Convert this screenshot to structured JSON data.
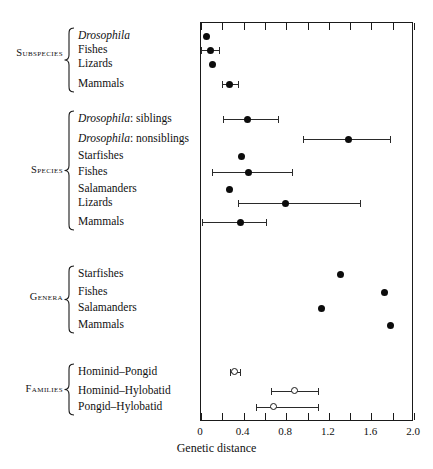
{
  "axis_title": "Genetic distance",
  "axis": {
    "labels": [
      "0",
      "0.4",
      "0.8",
      "1.2",
      "1.6",
      "2.0"
    ],
    "label_values": [
      0,
      0.4,
      0.8,
      1.2,
      1.6,
      2.0
    ],
    "minor_step": 0.2,
    "min": 0,
    "max": 2.0
  },
  "groups": [
    {
      "name": "Subspecies",
      "label": "Subspecies"
    },
    {
      "name": "Species",
      "label": "Species"
    },
    {
      "name": "Genera",
      "label": "Genera"
    },
    {
      "name": "Families",
      "label": "Families"
    }
  ],
  "chart_data": {
    "type": "scatter",
    "title": "",
    "xlabel": "Genetic distance",
    "ylabel": "",
    "xlim": [
      0,
      2.0
    ],
    "grid": false,
    "legend": "none",
    "orientation": "horizontal",
    "marker_note": "filled circles = animal taxa; open circles = primate families",
    "groups": [
      {
        "group": "Subspecies",
        "points": [
          {
            "label": "Drosophila",
            "italic_label": true,
            "value": 0.06,
            "low": null,
            "high": null,
            "marker": "filled"
          },
          {
            "label": "Fishes",
            "italic_label": false,
            "value": 0.1,
            "low": 0.01,
            "high": 0.18,
            "marker": "filled"
          },
          {
            "label": "Lizards",
            "italic_label": false,
            "value": 0.12,
            "low": null,
            "high": null,
            "marker": "filled"
          },
          {
            "label": "Mammals",
            "italic_label": false,
            "value": 0.28,
            "low": 0.21,
            "high": 0.36,
            "marker": "filled"
          }
        ]
      },
      {
        "group": "Species",
        "points": [
          {
            "label": "Drosophila: siblings",
            "italic_label": true,
            "italic_prefix": "Drosophila",
            "rest": ": siblings",
            "value": 0.45,
            "low": 0.22,
            "high": 0.73,
            "marker": "filled"
          },
          {
            "label": "Drosophila: nonsiblings",
            "italic_label": true,
            "italic_prefix": "Drosophila",
            "rest": ": nonsiblings",
            "value": 1.39,
            "low": 0.97,
            "high": 1.78,
            "marker": "filled"
          },
          {
            "label": "Starfishes",
            "italic_label": false,
            "value": 0.39,
            "low": null,
            "high": null,
            "marker": "filled"
          },
          {
            "label": "Fishes",
            "italic_label": false,
            "value": 0.46,
            "low": 0.11,
            "high": 0.86,
            "marker": "filled"
          },
          {
            "label": "Salamanders",
            "italic_label": false,
            "value": 0.28,
            "low": null,
            "high": null,
            "marker": "filled"
          },
          {
            "label": "Lizards",
            "italic_label": false,
            "value": 0.8,
            "low": 0.36,
            "high": 1.5,
            "marker": "filled"
          },
          {
            "label": "Mammals",
            "italic_label": false,
            "value": 0.38,
            "low": 0.02,
            "high": 0.62,
            "marker": "filled"
          }
        ]
      },
      {
        "group": "Genera",
        "points": [
          {
            "label": "Starfishes",
            "italic_label": false,
            "value": 1.32,
            "low": null,
            "high": null,
            "marker": "filled"
          },
          {
            "label": "Fishes",
            "italic_label": false,
            "value": 1.73,
            "low": null,
            "high": null,
            "marker": "filled"
          },
          {
            "label": "Salamanders",
            "italic_label": false,
            "value": 1.14,
            "low": null,
            "high": null,
            "marker": "filled"
          },
          {
            "label": "Mammals",
            "italic_label": false,
            "value": 1.79,
            "low": null,
            "high": null,
            "marker": "filled"
          }
        ]
      },
      {
        "group": "Families",
        "points": [
          {
            "label": "Hominid–Pongid",
            "italic_label": false,
            "value": 0.33,
            "low": 0.28,
            "high": 0.38,
            "marker": "open"
          },
          {
            "label": "Hominid–Hylobatid",
            "italic_label": false,
            "value": 0.89,
            "low": 0.67,
            "high": 1.11,
            "marker": "open"
          },
          {
            "label": "Pongid–Hylobatid",
            "italic_label": false,
            "value": 0.69,
            "low": 0.53,
            "high": 1.11,
            "marker": "open"
          }
        ]
      }
    ]
  }
}
